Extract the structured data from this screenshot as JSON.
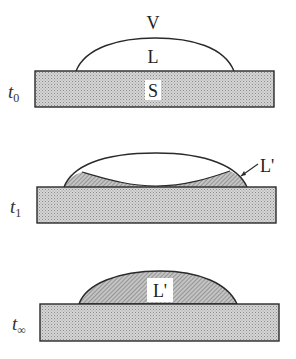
{
  "figure": {
    "colors": {
      "outline": "#2a2a2a",
      "substrate_fill": "#cfcfcf",
      "hatched_fill": "#a9a9a9",
      "background": "#ffffff"
    },
    "panels": [
      {
        "time_label": "t",
        "time_subscript": "0",
        "labels": {
          "vapor": "V",
          "liquid": "L",
          "solid": "S"
        }
      },
      {
        "time_label": "t",
        "time_subscript": "1",
        "labels": {
          "new_liquid": "L'"
        }
      },
      {
        "time_label": "t",
        "time_subscript": "∞",
        "labels": {
          "new_liquid": "L'"
        }
      }
    ]
  }
}
